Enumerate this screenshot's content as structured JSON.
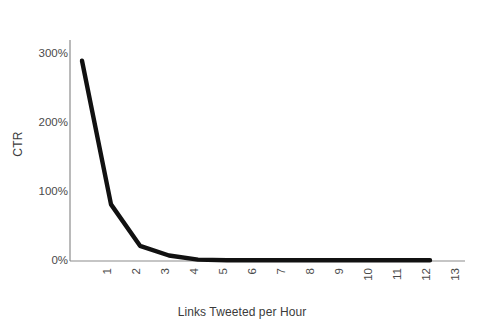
{
  "chart_data": {
    "type": "line",
    "title": "",
    "xlabel": "Links Tweeted per Hour",
    "ylabel": "CTR",
    "x": [
      1,
      2,
      3,
      4,
      5,
      6,
      7,
      8,
      9,
      10,
      11,
      12,
      13
    ],
    "xtick_labels": [
      "1",
      "2",
      "3",
      "4",
      "5",
      "6",
      "7",
      "8",
      "9",
      "10",
      "11",
      "12",
      "13"
    ],
    "values": [
      290,
      82,
      22,
      8,
      2,
      1,
      1,
      1,
      1,
      1,
      1,
      1,
      1
    ],
    "ytick_labels": [
      "0%",
      "100%",
      "200%",
      "300%"
    ],
    "ytick_values": [
      0,
      100,
      200,
      300
    ],
    "ylim": [
      0,
      320
    ],
    "xlim": [
      1,
      13
    ],
    "grid": false,
    "legend": false,
    "series_color": "#111111",
    "axis_color": "#8c8c8c",
    "background": "#ffffff"
  }
}
